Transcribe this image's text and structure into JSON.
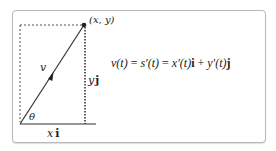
{
  "diagram": {
    "point_label": "(x, y)",
    "vector_label": "v",
    "angle_label": "θ",
    "horizontal_component": {
      "var": "x",
      "unit": "i"
    },
    "vertical_component": {
      "var": "y",
      "unit": "j"
    },
    "equation": {
      "lhs": "v(t)",
      "eq1": "=",
      "mid": "s′(t)",
      "eq2": "=",
      "term1_fn": "x′(t)",
      "term1_unit": "i",
      "plus": "+",
      "term2_fn": "y′(t)",
      "term2_unit": "j"
    },
    "colors": {
      "line": "#333333",
      "dashed": "#555555",
      "frame": "#b8b8b8"
    }
  }
}
